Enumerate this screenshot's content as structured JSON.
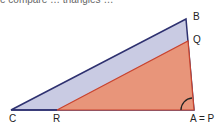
{
  "caption_cutoff": "e compare … triangles …",
  "diagram": {
    "colors": {
      "outer_fill": "#c9cbe3",
      "outer_stroke": "#2e3170",
      "inner_fill": "#e8957a",
      "inner_stroke": "#c9432e"
    },
    "labels": {
      "B": "B",
      "Q": "Q",
      "C": "C",
      "R": "R",
      "AP": "A = P"
    }
  }
}
